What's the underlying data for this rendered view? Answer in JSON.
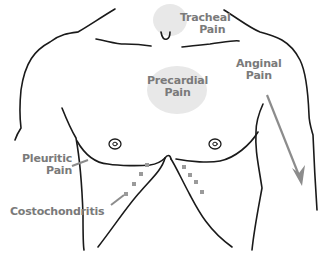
{
  "diagram": {
    "labels": {
      "tracheal": {
        "line1": "Tracheal",
        "line2": "Pain"
      },
      "precardial": {
        "line1": "Precardial",
        "line2": "Pain"
      },
      "anginal": {
        "line1": "Anginal",
        "line2": "Pain"
      },
      "pleuritic": {
        "line1": "Pleuritic",
        "line2": "Pain"
      },
      "costochondritis": {
        "line1": "Costochondritis"
      }
    },
    "colors": {
      "outline": "#1a1a1a",
      "label_text": "#7a7a7a",
      "highlight_patch": "#e6e6e6",
      "arrow": "#8c8c8c",
      "marker_dots": "#9a9a9a"
    }
  }
}
